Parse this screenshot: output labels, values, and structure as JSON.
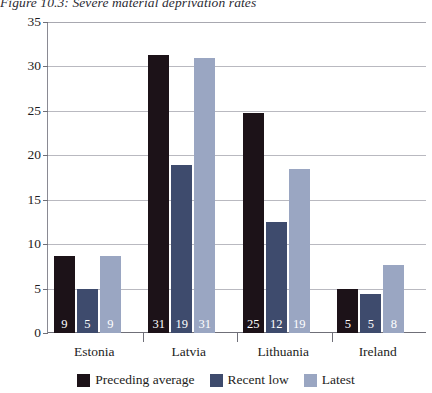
{
  "chart_data": {
    "type": "bar",
    "title": "Figure 10.3: Severe material deprivation rates",
    "xlabel": "",
    "ylabel": "",
    "ylim": [
      0,
      35
    ],
    "yticks": [
      0,
      5,
      10,
      15,
      20,
      25,
      30,
      35
    ],
    "grid": true,
    "legend_position": "bottom",
    "categories": [
      "Estonia",
      "Latvia",
      "Lithuania",
      "Ireland"
    ],
    "series": [
      {
        "name": "Preceding average",
        "color": "#1c1218",
        "values": [
          8.7,
          31.3,
          24.8,
          4.9
        ],
        "labels": [
          "9",
          "31",
          "25",
          "5"
        ]
      },
      {
        "name": "Recent low",
        "color": "#3e4b6d",
        "values": [
          4.9,
          18.9,
          12.5,
          4.4
        ],
        "labels": [
          "5",
          "19",
          "12",
          "5"
        ]
      },
      {
        "name": "Latest",
        "color": "#9aa6c2",
        "values": [
          8.7,
          30.9,
          18.5,
          7.6
        ],
        "labels": [
          "9",
          "31",
          "19",
          "8"
        ]
      }
    ]
  },
  "axis": {
    "tick_labels": [
      "35",
      "30",
      "25",
      "20",
      "15",
      "10",
      "5",
      "0"
    ]
  },
  "colors": {
    "preceding_average": "#1c1218",
    "recent_low": "#3e4b6d",
    "latest": "#9aa6c2",
    "axis": "#6f6f78",
    "grid": "#b9b9c0"
  }
}
